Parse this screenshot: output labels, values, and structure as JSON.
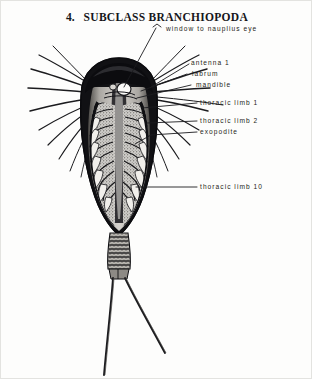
{
  "figure": {
    "number": "4.",
    "title": "SUBCLASS BRANCHIOPODA",
    "background_color": "#fdfdfc",
    "ink_color": "#16161a"
  },
  "labels": [
    {
      "id": "window-to-nauplius-eye",
      "text": "window to nauplius eye"
    },
    {
      "id": "antenna-1",
      "text": "antenna 1"
    },
    {
      "id": "labrum",
      "text": "labrum"
    },
    {
      "id": "mandible",
      "text": "mandible"
    },
    {
      "id": "thoracic-limb-1",
      "text": "thoracic limb 1"
    },
    {
      "id": "thoracic-limb-2",
      "text": "thoracic limb 2"
    },
    {
      "id": "exopodite",
      "text": "exopodite"
    },
    {
      "id": "thoracic-limb-10",
      "text": "thoracic limb 10"
    }
  ],
  "illustration": {
    "subject": "tadpole-shrimp-ventral-view",
    "parts": [
      "carapace-shield",
      "nauplius-eye-window",
      "antennal-setae",
      "labrum",
      "mandible",
      "thoracic-limb-series",
      "exopodite",
      "segmented-abdomen",
      "caudal-filaments"
    ]
  }
}
